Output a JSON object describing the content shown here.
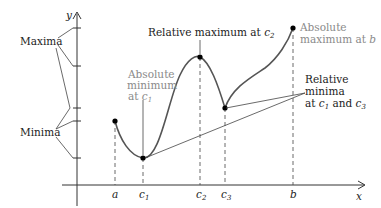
{
  "diagram": {
    "axes": {
      "y_label": "y",
      "x_label": "x"
    },
    "x_ticks": [
      {
        "label": "a",
        "sub": ""
      },
      {
        "label": "c",
        "sub": "1"
      },
      {
        "label": "c",
        "sub": "2"
      },
      {
        "label": "c",
        "sub": "3"
      },
      {
        "label": "b",
        "sub": ""
      }
    ],
    "side_labels": {
      "maxima": "Maxima",
      "minima": "Minima"
    },
    "annotations": {
      "relative_max": {
        "text": "Relative maximum at ",
        "var": "c",
        "sub": "2"
      },
      "absolute_min": {
        "line1": "Absolute",
        "line2": "minimum",
        "line3_prefix": "at ",
        "var": "c",
        "sub": "1"
      },
      "absolute_max": {
        "line1": "Absolute",
        "line2_prefix": "maximum at ",
        "var": "b"
      },
      "relative_min": {
        "line1": "Relative",
        "line2": "minima",
        "line3_prefix": "at ",
        "var1": "c",
        "sub1": "1",
        "mid": " and ",
        "var2": "c",
        "sub2": "3"
      }
    },
    "colors": {
      "curve": "#555555",
      "axis": "#333333",
      "gray_text": "#8a8a8a",
      "dark_text": "#222222"
    }
  }
}
